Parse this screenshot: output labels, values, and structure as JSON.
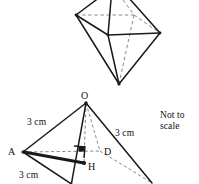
{
  "figure": {
    "note": "Not to\nscale",
    "note_line1": "Not to",
    "note_line2": "scale",
    "stroke_color": "#1a1a1a",
    "dashed_color": "#7a7a7a",
    "background_color": "#ffffff"
  },
  "octahedron": {
    "name": "octahedron",
    "solid_edges": [
      {
        "from": "top",
        "to": "left"
      },
      {
        "from": "top",
        "to": "front"
      },
      {
        "from": "top",
        "to": "right"
      },
      {
        "from": "left",
        "to": "front"
      },
      {
        "from": "front",
        "to": "right"
      },
      {
        "from": "left",
        "to": "bottom"
      },
      {
        "from": "front",
        "to": "bottom"
      },
      {
        "from": "right",
        "to": "bottom"
      }
    ],
    "dashed_edges": [
      {
        "from": "left",
        "to": "back"
      },
      {
        "from": "back",
        "to": "right"
      },
      {
        "from": "top",
        "to": "back"
      },
      {
        "from": "back",
        "to": "bottom"
      }
    ]
  },
  "pyramid": {
    "name": "square-pyramid",
    "vertices": [
      {
        "id": "O",
        "label": "O",
        "role": "apex"
      },
      {
        "id": "A",
        "label": "A",
        "role": "base-left"
      },
      {
        "id": "D",
        "label": "D",
        "role": "base-back"
      },
      {
        "id": "H",
        "label": "H",
        "role": "foot-of-perpendicular"
      }
    ],
    "edge_labels": [
      {
        "id": "OA",
        "label": "3 cm"
      },
      {
        "id": "OC",
        "label": "3 cm"
      },
      {
        "id": "AB",
        "label": "3 cm"
      }
    ],
    "right_angle_marker": true
  }
}
